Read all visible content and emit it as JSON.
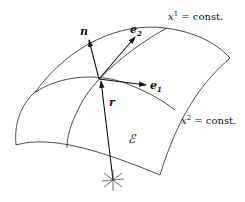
{
  "diagram": {
    "labels": {
      "n": "n",
      "e2": "e",
      "e2_sub": "2",
      "e1": "e",
      "e1_sub": "1",
      "r": "r",
      "surface": "ℰ",
      "x1_var": "x",
      "x1_sup": "1",
      "x1_rest": " = const.",
      "x2_var": "x",
      "x2_sup": "2",
      "x2_rest": " = const."
    },
    "colors": {
      "stroke": "#111111",
      "background": "#ffffff"
    }
  }
}
